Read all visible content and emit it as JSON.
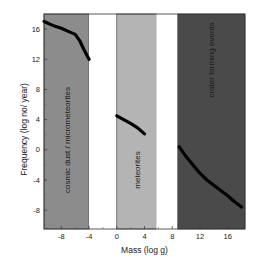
{
  "chart_data": {
    "type": "line",
    "title": "",
    "xlabel": "Mass (log g)",
    "ylabel": "Frequency (log no/ year)",
    "xlim": [
      -10.5,
      18.5
    ],
    "ylim": [
      -10.5,
      18
    ],
    "x_ticks": [
      -8,
      -4,
      0,
      4,
      8,
      12,
      16
    ],
    "y_ticks": [
      16,
      12,
      8,
      4,
      0,
      -4,
      -8
    ],
    "grid": false,
    "legend": null,
    "bands": [
      {
        "label": "cosmic dust / micrometeorites",
        "x_start": -10.5,
        "x_end": -4,
        "color": "#8c8c8c"
      },
      {
        "label": "",
        "x_start": -4,
        "x_end": 0,
        "color": "#ffffff"
      },
      {
        "label": "meteorites",
        "x_start": 0,
        "x_end": 5.7,
        "color": "#b4b4b4"
      },
      {
        "label": "",
        "x_start": 5.7,
        "x_end": 8.8,
        "color": "#ffffff"
      },
      {
        "label": "crater forming events",
        "x_start": 8.8,
        "x_end": 18.5,
        "color": "#4a4a4a"
      }
    ],
    "series": [
      {
        "name": "cosmic dust / micrometeorites",
        "x": [
          -10.5,
          -9,
          -8,
          -7,
          -6,
          -5.3,
          -4.8,
          -4.3,
          -4
        ],
        "y": [
          17,
          16.4,
          16.1,
          15.7,
          15.3,
          14.4,
          13.4,
          12.5,
          12
        ]
      },
      {
        "name": "meteorites",
        "x": [
          0,
          1,
          2,
          3,
          4
        ],
        "y": [
          4.5,
          4.0,
          3.5,
          2.9,
          2.1
        ]
      },
      {
        "name": "crater forming events",
        "x": [
          9,
          10,
          11,
          12,
          13,
          14,
          15,
          16,
          17,
          18
        ],
        "y": [
          0.4,
          -0.9,
          -2.0,
          -3.1,
          -4.0,
          -4.7,
          -5.4,
          -6.1,
          -6.9,
          -7.6
        ]
      }
    ]
  }
}
